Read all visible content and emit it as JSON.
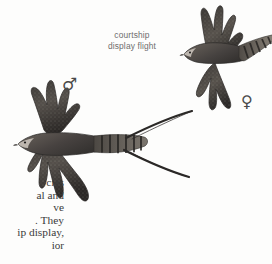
{
  "plate": {
    "background_color": "#fdfdfc",
    "subject": "two raptors in flight",
    "illustration_style": "field guide ink and wash"
  },
  "callout": {
    "name": "courtship display flight",
    "line1": "courtship",
    "line2": "display flight",
    "color": "#6d6d6d"
  },
  "symbols": {
    "male": "♂",
    "female": "♀",
    "color": "#4a4a4a"
  },
  "birds": [
    {
      "id": "male",
      "sex_symbol": "♂",
      "description": "male in flight, long forked tail streamers, barred tail",
      "plumage_color": "#2e2c2a"
    },
    {
      "id": "female",
      "sex_symbol": "♀",
      "description": "female in flight, short barred tail, no streamers",
      "plumage_color": "#2e2c2a"
    }
  ],
  "body_text": {
    "note": "paragraph clipped at the left page edge",
    "lines": [
      "cies",
      "al and",
      "ve",
      ". They",
      "ip display,",
      "ior"
    ]
  }
}
